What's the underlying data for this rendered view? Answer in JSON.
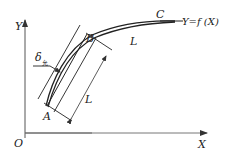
{
  "diagram": {
    "axes": {
      "y_label": "Y",
      "x_label": "X",
      "origin_label": "O"
    },
    "curve": {
      "function_label": "Y=f (X)",
      "points": {
        "start": "A",
        "mid": "B",
        "end": "C"
      },
      "segment_bc_label": "L"
    },
    "tolerance": {
      "symbol": "δ",
      "subscript": "允"
    },
    "dimension": {
      "chord_length_label": "L"
    },
    "colors": {
      "line": "#222222",
      "axis": "#555555",
      "background": "#ffffff"
    }
  }
}
